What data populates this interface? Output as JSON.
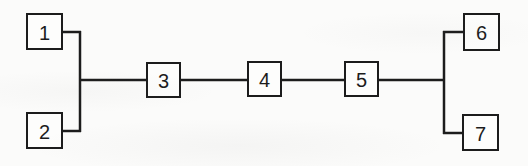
{
  "diagram": {
    "type": "block-diagram",
    "background_color": "#fbfbfa",
    "line_color": "#1c1c1c",
    "line_width": 2.5,
    "box_fill": "#fdfdfc",
    "box_border_color": "#1c1c1c",
    "box_border_width": 2,
    "nodes": [
      {
        "label": "1",
        "x": 27,
        "y": 14,
        "w": 35,
        "h": 35
      },
      {
        "label": "2",
        "x": 27,
        "y": 113,
        "w": 35,
        "h": 35
      },
      {
        "label": "3",
        "x": 147,
        "y": 63,
        "w": 33,
        "h": 34
      },
      {
        "label": "4",
        "x": 248,
        "y": 62,
        "w": 33,
        "h": 34
      },
      {
        "label": "5",
        "x": 345,
        "y": 62,
        "w": 33,
        "h": 34
      },
      {
        "label": "6",
        "x": 464,
        "y": 14,
        "w": 35,
        "h": 36
      },
      {
        "label": "7",
        "x": 463,
        "y": 115,
        "w": 35,
        "h": 35
      }
    ],
    "edges": [
      {
        "name": "stub-node1-to-left-bus",
        "x1": 62,
        "y1": 32,
        "x2": 81,
        "y2": 32
      },
      {
        "name": "stub-node2-to-left-bus",
        "x1": 62,
        "y1": 131,
        "x2": 81,
        "y2": 131
      },
      {
        "name": "left-vertical-bus",
        "x1": 80,
        "y1": 31,
        "x2": 80,
        "y2": 132
      },
      {
        "name": "main-horizontal-bus",
        "x1": 80,
        "y1": 80,
        "x2": 444,
        "y2": 80
      },
      {
        "name": "right-vertical-bus",
        "x1": 444,
        "y1": 31,
        "x2": 444,
        "y2": 134
      },
      {
        "name": "stub-right-bus-to-node6",
        "x1": 443,
        "y1": 32,
        "x2": 464,
        "y2": 32
      },
      {
        "name": "stub-right-bus-to-node7",
        "x1": 443,
        "y1": 133,
        "x2": 463,
        "y2": 133
      }
    ],
    "connectivity": {
      "parallel_left": [
        "1",
        "2"
      ],
      "series_middle": [
        "3",
        "4",
        "5"
      ],
      "parallel_right": [
        "6",
        "7"
      ]
    }
  }
}
